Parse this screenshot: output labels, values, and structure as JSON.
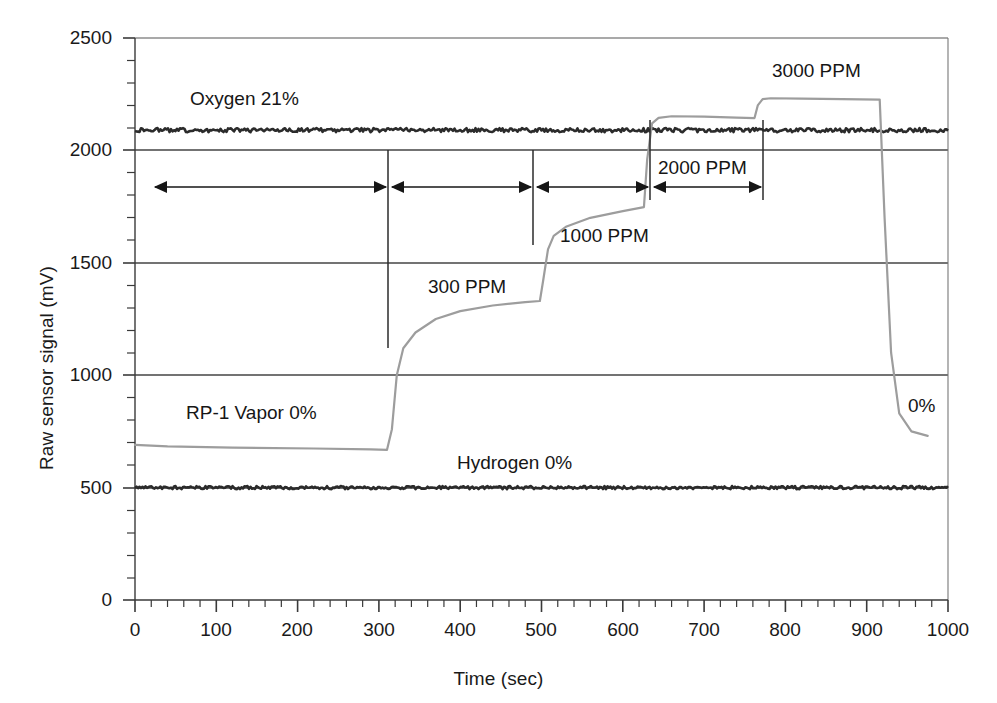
{
  "chart_data": {
    "type": "line",
    "title": "",
    "xlabel": "Time (sec)",
    "ylabel": "Raw sensor signal (mV)",
    "xlim": [
      0,
      1000
    ],
    "ylim": [
      0,
      2500
    ],
    "xticks": [
      0,
      100,
      200,
      300,
      400,
      500,
      600,
      700,
      800,
      900,
      1000
    ],
    "yticks": [
      0,
      500,
      1000,
      1500,
      2000,
      2500
    ],
    "x_minor_tick_interval": 20,
    "y_minor_tick_interval": 100,
    "grid": "horizontal-major-only",
    "legend_position": "inline-annotations",
    "series": [
      {
        "name": "Oxygen 21%",
        "color": "#2b2b2b",
        "style": "noisy-flat",
        "label": "Oxygen 21%",
        "x": [
          0,
          100,
          200,
          300,
          400,
          500,
          600,
          700,
          800,
          900,
          1000
        ],
        "values": [
          2090,
          2090,
          2090,
          2090,
          2090,
          2090,
          2090,
          2090,
          2090,
          2090,
          2090
        ]
      },
      {
        "name": "Hydrogen 0%",
        "color": "#2b2b2b",
        "style": "noisy-flat",
        "label": "Hydrogen 0%",
        "x": [
          0,
          100,
          200,
          300,
          400,
          500,
          600,
          700,
          800,
          900,
          1000
        ],
        "values": [
          500,
          500,
          500,
          500,
          500,
          500,
          500,
          500,
          500,
          500,
          500
        ]
      },
      {
        "name": "RP-1 Vapor",
        "color": "#9a9a9a",
        "style": "step-response",
        "label": "RP-1 Vapor 0%",
        "x": [
          0,
          40,
          120,
          220,
          290,
          310,
          316,
          322,
          330,
          345,
          370,
          400,
          440,
          480,
          498,
          502,
          508,
          515,
          530,
          560,
          600,
          626,
          630,
          636,
          644,
          660,
          700,
          740,
          762,
          766,
          772,
          782,
          820,
          870,
          916,
          922,
          930,
          940,
          955,
          975
        ],
        "values": [
          690,
          683,
          678,
          674,
          670,
          668,
          760,
          1000,
          1120,
          1190,
          1250,
          1285,
          1310,
          1325,
          1330,
          1420,
          1560,
          1620,
          1660,
          1700,
          1730,
          1748,
          1960,
          2120,
          2145,
          2152,
          2150,
          2146,
          2144,
          2200,
          2228,
          2232,
          2230,
          2228,
          2226,
          1700,
          1100,
          830,
          750,
          730
        ]
      }
    ],
    "annotations": [
      {
        "name": "oxygen-label",
        "text": "Oxygen 21%",
        "x_px": 190,
        "y_px": 88
      },
      {
        "name": "rp1-vapor-label",
        "text": "RP-1 Vapor 0%",
        "x_px": 186,
        "y_px": 402
      },
      {
        "name": "hydrogen-label",
        "text": "Hydrogen 0%",
        "x_px": 457,
        "y_px": 452
      },
      {
        "name": "ppm-300-label",
        "text": "300 PPM",
        "x_px": 428,
        "y_px": 276
      },
      {
        "name": "ppm-1000-label",
        "text": "1000 PPM",
        "x_px": 560,
        "y_px": 225
      },
      {
        "name": "ppm-2000-label",
        "text": "2000 PPM",
        "x_px": 658,
        "y_px": 157
      },
      {
        "name": "ppm-3000-label",
        "text": "3000 PPM",
        "x_px": 772,
        "y_px": 60
      },
      {
        "name": "zero-percent-label",
        "text": "0%",
        "x_px": 908,
        "y_px": 395
      }
    ],
    "phase_arrows": [
      {
        "name": "phase-arrow-baseline",
        "from_x_px": 155,
        "to_x_px": 386,
        "y_px": 187,
        "concentration_ppm": 0
      },
      {
        "name": "phase-arrow-300ppm",
        "from_x_px": 392,
        "to_x_px": 531,
        "y_px": 187,
        "concentration_ppm": 300
      },
      {
        "name": "phase-arrow-1000ppm",
        "from_x_px": 537,
        "to_x_px": 648,
        "y_px": 187,
        "concentration_ppm": 1000
      },
      {
        "name": "phase-arrow-2000ppm",
        "from_x_px": 654,
        "to_x_px": 761,
        "y_px": 187,
        "concentration_ppm": 2000
      }
    ],
    "phase_dividers": [
      {
        "name": "phase-divider-1",
        "x_px": 388,
        "y_top_px": 150,
        "y_bottom_px": 348
      },
      {
        "name": "phase-divider-2",
        "x_px": 533,
        "y_top_px": 150,
        "y_bottom_px": 245
      },
      {
        "name": "phase-divider-3",
        "x_px": 650,
        "y_top_px": 120,
        "y_bottom_px": 200
      },
      {
        "name": "phase-divider-4",
        "x_px": 763,
        "y_px": 120,
        "y_top_px": 120,
        "y_bottom_px": 200
      }
    ]
  },
  "axes": {
    "y_title": "Raw sensor signal (mV)",
    "x_title": "Time (sec)",
    "y_tick_labels": [
      "2500",
      "2000",
      "1500",
      "1000",
      "500",
      "0"
    ],
    "x_tick_labels": [
      "0",
      "100",
      "200",
      "300",
      "400",
      "500",
      "600",
      "700",
      "800",
      "900",
      "1000"
    ]
  },
  "colors": {
    "axis": "#333333",
    "grid": "#444444",
    "dark_trace": "#2b2b2b",
    "gray_trace": "#9d9d9d",
    "text": "#1a1a1a",
    "background": "#ffffff"
  }
}
